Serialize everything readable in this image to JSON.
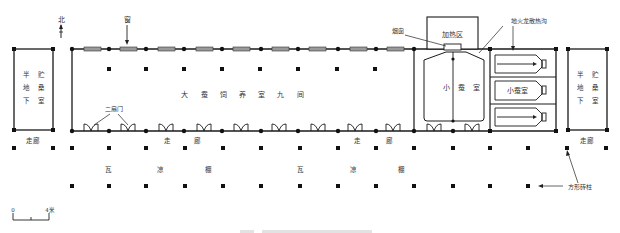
{
  "diagram": {
    "type": "architectural-floor-plan",
    "labels": {
      "north": "北",
      "window": "窗",
      "chimney": "烟囱",
      "heating_area": "加热区",
      "ground_fire_flue": "地火龙散热沟",
      "main_hall": "大 蚕 饲 养 室 九 间",
      "double_door": "二扇门",
      "small_silkworm_room_large": "小 蚕 室",
      "small_silkworm_room_box": "小蚕室",
      "left_storage": {
        "col1": [
          "半",
          "地",
          "下"
        ],
        "col2": [
          "贮",
          "桑",
          "室"
        ]
      },
      "right_storage": {
        "col1": [
          "半",
          "地",
          "下"
        ],
        "col2": [
          "贮",
          "桑",
          "室"
        ]
      },
      "corridor": "走廊",
      "corridor_split": [
        "走",
        "廊"
      ],
      "shed_split": [
        "瓦",
        "凉",
        "棚"
      ],
      "square_brick_pillar": "方形砖柱"
    },
    "scale_bar": {
      "start": "0",
      "end": "4米"
    },
    "colors": {
      "line": "#1a1a1a",
      "window_fill": "#9a9a9a",
      "text": "#333333"
    }
  }
}
